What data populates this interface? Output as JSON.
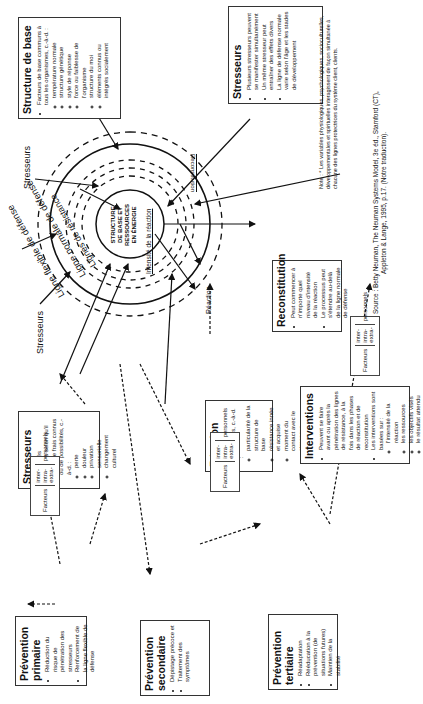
{
  "diagram": {
    "center": [
      "STRUCTURE",
      "DE BASE ET",
      "RESSOURCES",
      "EN ÉNERGIE"
    ],
    "ring_labels": {
      "flexible": "Ligne flexible de défense",
      "normal": "Ligne normale de défense",
      "resistance": "Lignes de résistance"
    },
    "inner_labels": {
      "intensity": "Intensité de la réaction",
      "reaction": "Réaction",
      "reconstitution": "Reconstitution"
    },
    "stressor_labels": [
      "Stresseurs",
      "Stresseurs"
    ]
  },
  "boxes": {
    "structure_base": {
      "title": "Structure de base",
      "intro": "Facteurs de base communs à tous les organismes, c.-à-d. :",
      "items": [
        "température normale",
        "structure génétique",
        "style de réponse",
        "force ou faiblesse de l'organisme",
        "structure du moi",
        "éléments connus ou intégrés socialement"
      ]
    },
    "stresseurs_right": {
      "title": "Stresseurs",
      "items": [
        "Plusieurs stresseurs peuvent se manifester simultanément",
        "Un même stresseur peut entraîner des effets divers",
        "La ligne de défense normale varie selon l'âge et les stades de développement"
      ]
    },
    "stresseurs_left": {
      "title": "Stresseurs",
      "items": [
        "Identifiés",
        "Classés selon qu'il s'agit de frais connus ou de possibilités, c.-à-d. :"
      ],
      "subitems": [
        "perte",
        "douleur",
        "privation sensorielle",
        "changement culturel"
      ]
    },
    "reaction": {
      "title": "Réaction",
      "intro": "Facteurs personnels, c.-à-d. :",
      "items": [
        "particularité de la structure de base",
        "résistance innée et acquise",
        "moment du contact avec le stresseur"
      ]
    },
    "reconstitution": {
      "title": "Reconstitution",
      "items": [
        "Peut commencer à n'importe quel niveau d'intensité de la réaction",
        "Le processus peut s'étendre au-delà de la ligne normale de défense"
      ]
    },
    "interventions": {
      "title": "Interventions",
      "items": [
        "Peuvent se faire avant ou après la pénétration des lignes de résistance, à la fois dans les phases de réaction et de reconstitution",
        "Les interventions sont basées sur :"
      ],
      "subitems": [
        "l'intensité de la réaction",
        "les ressources",
        "les objectifs visés",
        "le résultat attendu"
      ]
    },
    "prevention_primaire": {
      "title": "Prévention primaire",
      "items": [
        "Réduction du risque de pénétration des stresseurs",
        "Renforcement de la ligne flexible de défense"
      ]
    },
    "prevention_secondaire": {
      "title": "Prévention secondaire",
      "items": [
        "Dépistage précoce et",
        "Traitement des symptômes"
      ]
    },
    "prevention_tertiaire": {
      "title": "Prévention tertiaire",
      "items": [
        "Réadaptation",
        "Rééducation à la prévention (de situations futures)",
        "Maintien de la stabilité"
      ]
    }
  },
  "factors": {
    "label": "Facteurs",
    "types": [
      "inter-",
      "intra-",
      "extra-"
    ],
    "suffix": "personnels"
  },
  "note": {
    "label": "Note :",
    "text": "* Les variables physiologiques, psychologiques, socioculturelles, développementales et spirituelles interagissent de façon simultanée à chacune des lignes protectrices du système client, clients."
  },
  "source": {
    "line1": "Source : Betty Neuman, The Neuman Systems Model, 3e éd., Stamford (CT),",
    "line2": "Appleton & Lange, 1995, p.17. (Notre traduction)."
  }
}
